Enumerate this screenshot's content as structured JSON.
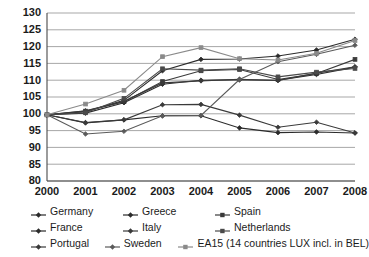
{
  "chart_data": {
    "type": "line",
    "title": "",
    "xlabel": "",
    "ylabel": "",
    "x": [
      2000,
      2001,
      2002,
      2003,
      2004,
      2005,
      2006,
      2007,
      2008
    ],
    "categories": [
      "2000",
      "2001",
      "2002",
      "2003",
      "2004",
      "2005",
      "2006",
      "2007",
      "2008"
    ],
    "ylim": [
      80,
      130
    ],
    "yticks": [
      80,
      85,
      90,
      95,
      100,
      105,
      110,
      115,
      120,
      125,
      130
    ],
    "grid": true,
    "legend_position": "bottom",
    "series": [
      {
        "name": "Germany",
        "color": "#2b2b2b",
        "marker": "diamond",
        "values": [
          99.7,
          97.3,
          98.2,
          99.4,
          99.4,
          95.8,
          94.4,
          94.6,
          94.3
        ]
      },
      {
        "name": "Greece",
        "color": "#2b2b2b",
        "marker": "diamond",
        "values": [
          99.7,
          100.6,
          104.0,
          112.8,
          116.2,
          116.3,
          117.2,
          119.0,
          122.2
        ]
      },
      {
        "name": "Spain",
        "color": "#3a3a3a",
        "marker": "square",
        "values": [
          99.7,
          100.8,
          103.6,
          109.6,
          112.8,
          113.2,
          110.2,
          112.0,
          116.2
        ]
      },
      {
        "name": "France",
        "color": "#2b2b2b",
        "marker": "diamond",
        "values": [
          99.7,
          100.2,
          103.3,
          108.8,
          110.0,
          110.1,
          110.0,
          111.7,
          113.9
        ]
      },
      {
        "name": "Italy",
        "color": "#3a3a3a",
        "marker": "diamond",
        "values": [
          99.7,
          100.9,
          103.7,
          109.2,
          109.8,
          110.3,
          109.9,
          112.1,
          114.0
        ]
      },
      {
        "name": "Netherlands",
        "color": "#4a4a4a",
        "marker": "square",
        "values": [
          99.7,
          100.3,
          104.6,
          113.4,
          113.0,
          113.4,
          111.0,
          112.4,
          113.5
        ]
      },
      {
        "name": "Portugal",
        "color": "#3a3a3a",
        "marker": "diamond",
        "values": [
          99.7,
          97.4,
          98.2,
          102.7,
          102.8,
          99.6,
          96.0,
          97.5,
          94.3
        ]
      },
      {
        "name": "Sweden",
        "color": "#5a5a5a",
        "marker": "diamond",
        "values": [
          99.7,
          94.0,
          94.8,
          99.4,
          99.5,
          110.2,
          115.5,
          117.7,
          120.4
        ]
      },
      {
        "name": "EA15 (14 countries LUX incl. in BEL)",
        "color": "#8a8a8a",
        "marker": "square",
        "values": [
          99.7,
          102.9,
          107.0,
          117.0,
          119.7,
          116.4,
          116.0,
          118.0,
          121.8
        ]
      }
    ]
  },
  "legend": {
    "rows": [
      [
        {
          "label": "Germany",
          "series_index": 0
        },
        {
          "label": "Greece",
          "series_index": 1
        },
        {
          "label": "Spain",
          "series_index": 2
        }
      ],
      [
        {
          "label": "France",
          "series_index": 3
        },
        {
          "label": "Italy",
          "series_index": 4
        },
        {
          "label": "Netherlands",
          "series_index": 5
        }
      ],
      [
        {
          "label": "Portugal",
          "series_index": 6
        },
        {
          "label": "Sweden",
          "series_index": 7
        },
        {
          "label": "EA15 (14 countries LUX incl. in BEL)",
          "series_index": 8
        }
      ]
    ]
  }
}
